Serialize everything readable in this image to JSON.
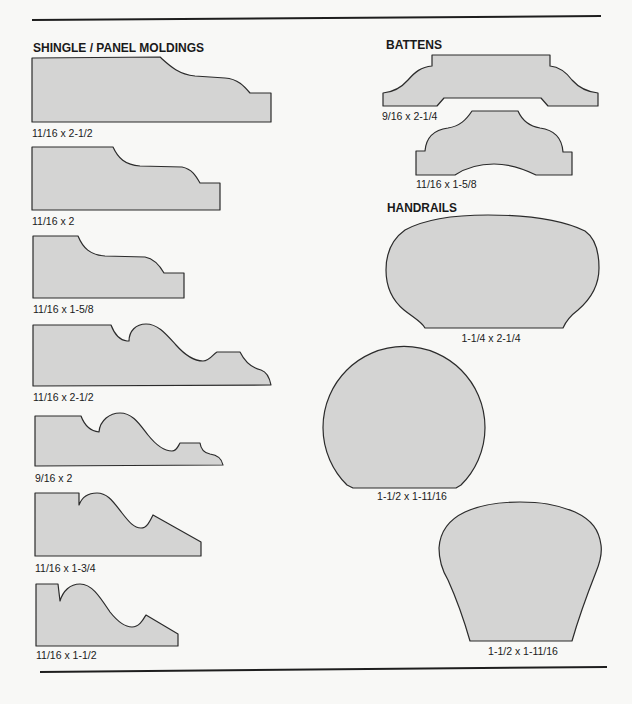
{
  "colors": {
    "background": "#f8f8f6",
    "profile_fill": "#d4d4d3",
    "profile_stroke": "#2b2b2b",
    "rule": "#1e1e1e",
    "text": "#1a1a1a"
  },
  "sections": {
    "shingle_panel_moldings": {
      "title": "SHINGLE / PANEL MOLDINGS",
      "profiles": [
        {
          "size": "11/16 x 2-1/2"
        },
        {
          "size": "11/16 x 2"
        },
        {
          "size": "11/16 x 1-5/8"
        },
        {
          "size": "11/16 x 2-1/2"
        },
        {
          "size": "9/16 x 2"
        },
        {
          "size": "11/16 x 1-3/4"
        },
        {
          "size": "11/16 x 1-1/2"
        }
      ]
    },
    "battens": {
      "title": "BATTENS",
      "profiles": [
        {
          "size": "9/16 x 2-1/4"
        },
        {
          "size": "11/16 x 1-5/8"
        }
      ]
    },
    "handrails": {
      "title": "HANDRAILS",
      "profiles": [
        {
          "size": "1-1/4 x 2-1/4"
        },
        {
          "size": "1-1/2 x 1-11/16"
        },
        {
          "size": "1-1/2 x 1-11/16"
        }
      ]
    }
  }
}
